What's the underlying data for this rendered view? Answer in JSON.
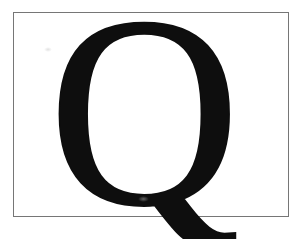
{
  "card": {
    "background_color": "#ffffff"
  },
  "frame": {
    "border_color": "#767676"
  },
  "letter": {
    "glyph": "Q",
    "color": "#0e0e0e"
  }
}
